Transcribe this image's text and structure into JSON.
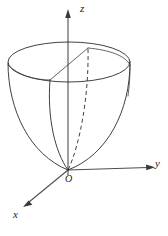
{
  "figure": {
    "background_color": "#ffffff",
    "line_color": "#2b2b2b",
    "axis_color": "#4d4d4d"
  },
  "axes": [
    {
      "name": "z-axis",
      "label": "z",
      "direction": "up",
      "origin": [
        68,
        170
      ],
      "tip": [
        68,
        12
      ],
      "label_pos": [
        80,
        3
      ]
    },
    {
      "name": "y-axis",
      "label": "y",
      "direction": "right",
      "origin": [
        68,
        170
      ],
      "tip": [
        153,
        167
      ],
      "label_pos": [
        155,
        158
      ]
    },
    {
      "name": "x-axis",
      "label": "x",
      "direction": "down-left",
      "origin": [
        68,
        170
      ],
      "tip": [
        24,
        206
      ],
      "label_pos": [
        13,
        209
      ]
    }
  ],
  "origin": {
    "label": "O",
    "position": [
      68,
      170
    ],
    "label_pos": [
      65,
      174
    ]
  },
  "surface": {
    "type": "paraboloid",
    "opening": "upward",
    "apex": [
      68,
      170
    ],
    "rim_ellipse": {
      "center": [
        69,
        62
      ],
      "rx": 61,
      "ry": 20
    },
    "inner_rim_arc": {
      "description": "far inner rim of the cut opening",
      "from": [
        88,
        48
      ],
      "to": [
        130,
        66
      ]
    },
    "wedge": {
      "description": "sector cut revealing the interior of the cup",
      "radius_line_left": {
        "from": [
          50,
          80
        ],
        "to": [
          88,
          48
        ]
      },
      "interior_curve_left": {
        "from": [
          50,
          80
        ],
        "to": [
          68,
          170
        ],
        "style": "solid"
      },
      "interior_curve_right": {
        "from": [
          88,
          48
        ],
        "to": [
          68,
          170
        ],
        "style": "dashed"
      }
    },
    "silhouette": {
      "left": {
        "from": [
          8,
          63
        ],
        "to": [
          68,
          170
        ]
      },
      "right": {
        "from": [
          130,
          63
        ],
        "to": [
          68,
          170
        ]
      }
    }
  }
}
